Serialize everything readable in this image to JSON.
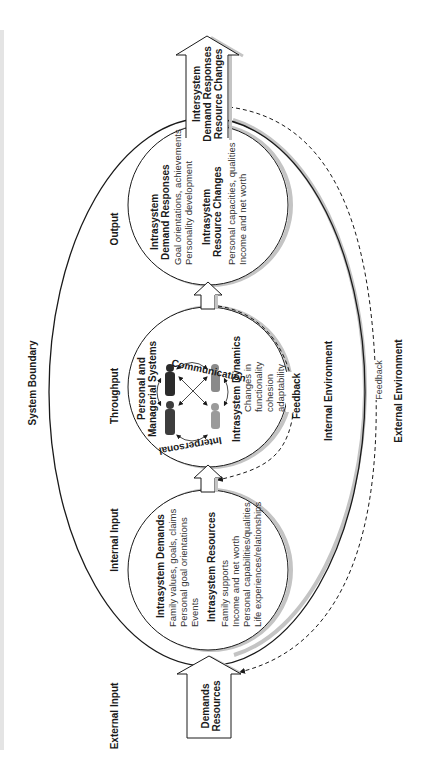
{
  "figure": {
    "orientation": "rotated-90-ccw",
    "colors": {
      "line": "#1a1a1a",
      "shadow": "#bdbdbd",
      "text": "#1a1a1a",
      "background": "#ffffff"
    }
  },
  "labels": {
    "system_boundary": "System Boundary",
    "external_input": "External Input",
    "internal_input": "Internal Input",
    "throughput": "Throughput",
    "output": "Output",
    "internal_environment": "Internal Environment",
    "external_environment": "External Environment",
    "feedback_outer": "Feedback",
    "feedback_inner": "Feedback"
  },
  "external_input_arrow": {
    "line1": "Demands",
    "line2": "Resources"
  },
  "output_arrow": {
    "line1": "Intersystem",
    "line2": "Demand Responses",
    "line3": "Resource Changes"
  },
  "input_circle": {
    "demands_title": "Intrasystem Demands",
    "demands_items": [
      "Family values, goals, claims",
      "Personal goal orientations",
      "Events"
    ],
    "resources_title": "Intrasystem Resources",
    "resources_items": [
      "Family supports",
      "Income and net worth",
      "Personal capabilities/qualities",
      "Life experiences/relationships"
    ]
  },
  "throughput_circle": {
    "title_line1": "Personal and",
    "title_line2": "Managerial Systems",
    "communication": "Communication",
    "interpersonal": "Interpersonal",
    "dynamics_title": "Intrasystem Dynamics",
    "dynamics_items": [
      "Changes in",
      "functionality",
      "cohesion",
      "adaptability"
    ]
  },
  "output_circle": {
    "responses_title_line1": "Intrasystem",
    "responses_title_line2": "Demand Responses",
    "responses_items": [
      "Goal orientations, achievements",
      "Personality development"
    ],
    "changes_title_line1": "Intrasystem",
    "changes_title_line2": "Resource Changes",
    "changes_items": [
      "Personal capacities, qualities",
      "Income and net worth"
    ]
  }
}
